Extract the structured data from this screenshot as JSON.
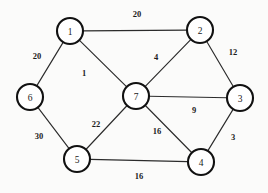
{
  "figure": {
    "kind": "undirected-weighted-graph",
    "background_color": "#fbfbfa",
    "node_fill_color": "#ffffff",
    "node_stroke_color": "#111111",
    "edge_color": "#2b2b2b",
    "label_color": "#1a1a1a"
  },
  "nodes": [
    {
      "id": "1",
      "label": "1",
      "x": 70,
      "y": 31,
      "r": 13
    },
    {
      "id": "2",
      "label": "2",
      "x": 200,
      "y": 30,
      "r": 13
    },
    {
      "id": "3",
      "label": "3",
      "x": 240,
      "y": 98,
      "r": 13
    },
    {
      "id": "4",
      "label": "4",
      "x": 201,
      "y": 162,
      "r": 13
    },
    {
      "id": "5",
      "label": "5",
      "x": 77,
      "y": 159,
      "r": 13
    },
    {
      "id": "6",
      "label": "6",
      "x": 30,
      "y": 97,
      "r": 13
    },
    {
      "id": "7",
      "label": "7",
      "x": 136,
      "y": 96,
      "r": 13
    }
  ],
  "edges": [
    {
      "id": "e-1-2",
      "from": "1",
      "to": "2",
      "weight": "20",
      "label_x": 137,
      "label_y": 14
    },
    {
      "id": "e-1-6",
      "from": "1",
      "to": "6",
      "weight": "20",
      "label_x": 37,
      "label_y": 56
    },
    {
      "id": "e-1-7",
      "from": "1",
      "to": "7",
      "weight": "1",
      "label_x": 84,
      "label_y": 73
    },
    {
      "id": "e-2-7",
      "from": "2",
      "to": "7",
      "weight": "4",
      "label_x": 156,
      "label_y": 57
    },
    {
      "id": "e-2-3",
      "from": "2",
      "to": "3",
      "weight": "12",
      "label_x": 233,
      "label_y": 52
    },
    {
      "id": "e-7-3",
      "from": "7",
      "to": "3",
      "weight": "9",
      "label_x": 194,
      "label_y": 110
    },
    {
      "id": "e-3-4",
      "from": "3",
      "to": "4",
      "weight": "3",
      "label_x": 233,
      "label_y": 137
    },
    {
      "id": "e-7-4",
      "from": "7",
      "to": "4",
      "weight": "16",
      "label_x": 157,
      "label_y": 131
    },
    {
      "id": "e-7-5",
      "from": "7",
      "to": "5",
      "weight": "22",
      "label_x": 96,
      "label_y": 124
    },
    {
      "id": "e-6-5",
      "from": "6",
      "to": "5",
      "weight": "30",
      "label_x": 39,
      "label_y": 136
    },
    {
      "id": "e-5-4",
      "from": "5",
      "to": "4",
      "weight": "16",
      "label_x": 139,
      "label_y": 176
    }
  ]
}
